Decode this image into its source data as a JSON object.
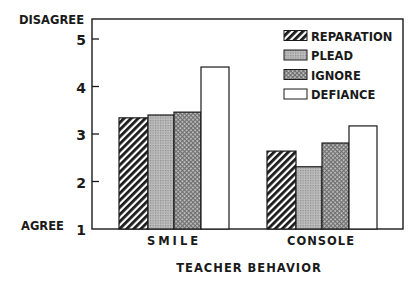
{
  "chart_data": {
    "type": "bar",
    "title": "",
    "xlabel": "TEACHER BEHAVIOR",
    "ylabel": "",
    "y_top_label": "DISAGREE",
    "y_bottom_label": "AGREE",
    "ylim": [
      1,
      5.4
    ],
    "yticks": [
      1,
      2,
      3,
      4,
      5
    ],
    "grid": false,
    "legend_position": "upper right",
    "categories": [
      "SMILE",
      "CONSOLE"
    ],
    "series": [
      {
        "name": "REPARATION",
        "pattern": "diagonal-hatch",
        "values": [
          3.34,
          2.64
        ]
      },
      {
        "name": "PLEAD",
        "pattern": "fine-grid",
        "values": [
          3.4,
          2.31
        ]
      },
      {
        "name": "IGNORE",
        "pattern": "crosshatch",
        "values": [
          3.46,
          2.81
        ]
      },
      {
        "name": "DEFIANCE",
        "pattern": "solid-white",
        "values": [
          4.41,
          3.17
        ]
      }
    ]
  }
}
